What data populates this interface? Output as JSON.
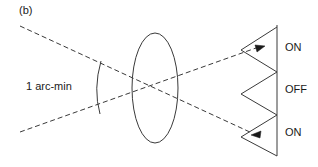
{
  "figure": {
    "panel_label": "(b)",
    "angle_label": "1 arc-min",
    "labels": {
      "on_top": "ON",
      "off_mid": "OFF",
      "on_bottom": "ON"
    },
    "colors": {
      "stroke": "#3a3a3a",
      "text": "#1a1a1a",
      "background": "#ffffff"
    },
    "elements": {
      "lens": "ellipse-lens",
      "detector_plane": "vertical-line",
      "zigzag": "sawtooth-mirror",
      "rays": "dashed-crossing-rays",
      "angle_arc": "arc-between-rays",
      "arrow_top": "arrowhead-right",
      "arrow_bottom": "arrowhead-left"
    }
  }
}
